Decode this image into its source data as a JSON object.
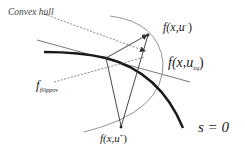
{
  "labels": {
    "convex_hull": "Convex hull",
    "f_minus": {
      "f": "f",
      "args_open": "(x,",
      "u": "u",
      "sup": "−",
      "close": ")"
    },
    "f_eq": {
      "f": "f",
      "args_open": "(x,",
      "u": "u",
      "sub": "eq",
      "close": ")"
    },
    "f_filippov": {
      "f": "f",
      "sub": "filippov"
    },
    "f_plus": {
      "f": "f",
      "args_open": "(x,",
      "u": "u",
      "sup": "+",
      "close": ")"
    },
    "surface": "s = 0"
  },
  "colors": {
    "surface_curve": "#1a1a1a",
    "thin_lines": "#444444",
    "dashed_lines": "#555555",
    "arc": "#666666",
    "text": "#222222"
  },
  "geometry": {
    "contact_point": [
      106,
      58
    ],
    "f_minus_tip": [
      148,
      35
    ],
    "f_eq_tip": [
      145,
      52
    ],
    "f_plus_tip": [
      121,
      127
    ]
  }
}
